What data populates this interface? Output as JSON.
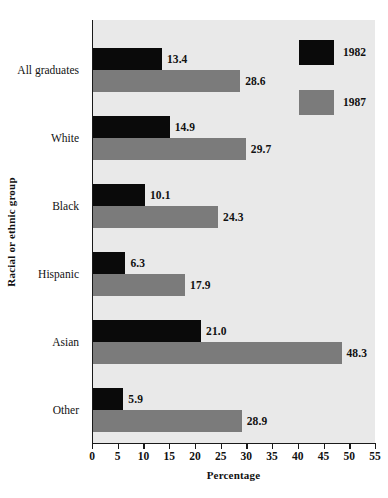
{
  "chart_data": {
    "type": "bar",
    "orientation": "horizontal",
    "title": "",
    "xlabel": "Percentage",
    "ylabel": "Racial or ethnic group",
    "categories": [
      "All graduates",
      "White",
      "Black",
      "Hispanic",
      "Asian",
      "Other"
    ],
    "series": [
      {
        "name": "1982",
        "color": "#0a0a0a",
        "values": [
          13.4,
          14.9,
          10.1,
          6.3,
          21.0,
          5.9
        ]
      },
      {
        "name": "1987",
        "color": "#7b7b7b",
        "values": [
          28.6,
          29.7,
          24.3,
          17.9,
          48.3,
          28.9
        ]
      }
    ],
    "value_labels": [
      [
        "13.4",
        "14.9",
        "10.1",
        "6.3",
        "21.0",
        "5.9"
      ],
      [
        "28.6",
        "29.7",
        "24.3",
        "17.9",
        "48.3",
        "28.9"
      ]
    ],
    "xlim": [
      0,
      55
    ],
    "xticks": [
      0,
      5,
      10,
      15,
      20,
      25,
      30,
      35,
      40,
      45,
      50,
      55
    ],
    "xtick_labels": [
      "0",
      "5",
      "10",
      "15",
      "20",
      "25",
      "30",
      "35",
      "40",
      "45",
      "50",
      "55"
    ],
    "grid": false,
    "legend_position": "top-right",
    "plot_background": "#e9e9e9",
    "figure_background": "#ffffff",
    "axis_color": "#1a1a1a"
  }
}
